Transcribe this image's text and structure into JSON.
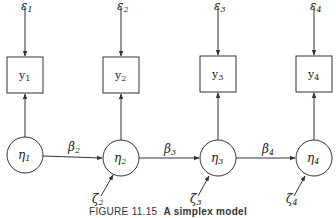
{
  "figure": {
    "caption_number": "FIGURE 11.15",
    "caption_title": "A simplex model",
    "line_color": "#333333",
    "background": "#ffffff"
  },
  "nodes": {
    "errors": [
      {
        "base": "ε",
        "sub": "1"
      },
      {
        "base": "ε",
        "sub": "2"
      },
      {
        "base": "ε",
        "sub": "3"
      },
      {
        "base": "ε",
        "sub": "4"
      }
    ],
    "observed": [
      {
        "base": "y",
        "sub": "1"
      },
      {
        "base": "y",
        "sub": "2"
      },
      {
        "base": "y",
        "sub": "3"
      },
      {
        "base": "y",
        "sub": "4"
      }
    ],
    "latent": [
      {
        "base": "η",
        "sub": "1"
      },
      {
        "base": "η",
        "sub": "2"
      },
      {
        "base": "η",
        "sub": "3"
      },
      {
        "base": "η",
        "sub": "4"
      }
    ],
    "disturbances": [
      {
        "base": "ζ",
        "sub": "2"
      },
      {
        "base": "ζ",
        "sub": "3"
      },
      {
        "base": "ζ",
        "sub": "4"
      }
    ]
  },
  "paths": [
    {
      "base": "β",
      "sub": "2"
    },
    {
      "base": "β",
      "sub": "3"
    },
    {
      "base": "β",
      "sub": "4"
    }
  ]
}
